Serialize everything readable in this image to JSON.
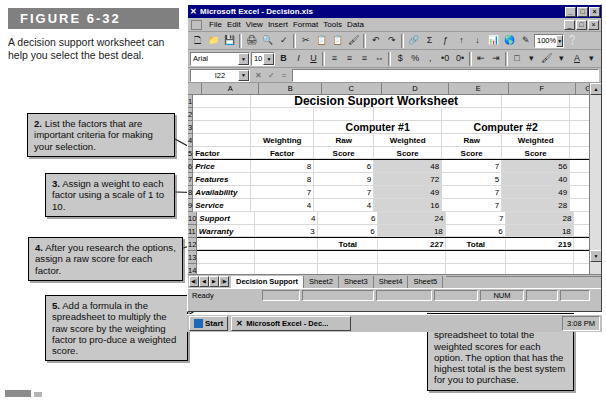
{
  "figure": {
    "label": "FIGURE 6-32",
    "caption": "A decision support worksheet can help you select the best deal.",
    "bar_color": "#808080"
  },
  "callouts": [
    {
      "num": "1.",
      "text": " List at least two possible options. This worksheet is designed to help you choose between Computer #1 and Computer #2."
    },
    {
      "num": "2.",
      "text": " List the factors that are important criteria for making your selection."
    },
    {
      "num": "3.",
      "text": " Assign a weight to each factor using a scale of 1 to 10."
    },
    {
      "num": "4.",
      "text": " After you research the options, assign a raw score for each factor."
    },
    {
      "num": "5.",
      "text": " Add a formula in the spreadsheet to multiply the raw score by the weighting factor to pro-duce a weighted score."
    },
    {
      "num": "6.",
      "text": " Add a formula in the spreadsheet to total the weighted scores for each option. The option that has the highest total is the best system for you to purchase."
    }
  ],
  "excel": {
    "title": "Microsoft Excel - Decision.xls",
    "title_icon": "excel-x-icon",
    "window_buttons": [
      "_",
      "□",
      "×"
    ],
    "child_window_buttons": [
      "_",
      "□",
      "×"
    ],
    "menus": [
      "File",
      "Edit",
      "View",
      "Insert",
      "Format",
      "Tools",
      "Data",
      "Window",
      "Help"
    ],
    "toolbar_icons": [
      "new-icon",
      "open-icon",
      "save-icon",
      "print-icon",
      "print-preview-icon",
      "spelling-icon",
      "cut-icon",
      "copy-icon",
      "paste-icon",
      "format-painter-icon",
      "undo-icon",
      "redo-icon",
      "hyperlink-icon",
      "autosum-icon",
      "function-icon",
      "sort-asc-icon",
      "sort-desc-icon",
      "chart-wizard-icon",
      "map-icon",
      "drawing-icon"
    ],
    "zoom_value": "100%",
    "formatting": {
      "font_name": "Arial",
      "font_size": "10",
      "bold": "B",
      "italic": "I",
      "underline": "U",
      "align_icons": [
        "align-left-icon",
        "align-center-icon",
        "align-right-icon",
        "merge-center-icon"
      ],
      "number_icons": [
        "currency-icon",
        "percent-icon",
        "comma-icon",
        "increase-decimal-icon",
        "decrease-decimal-icon"
      ],
      "indent_icons": [
        "decrease-indent-icon",
        "increase-indent-icon"
      ],
      "color_icons": [
        "borders-icon",
        "fill-color-icon",
        "font-color-icon"
      ]
    },
    "formula_bar": {
      "name_box": "I22",
      "cancel_icon": "cancel-icon",
      "enter_icon": "enter-icon",
      "function_icon": "function-icon",
      "formula_value": ""
    },
    "columns": [
      "A",
      "B",
      "C",
      "D",
      "E",
      "F",
      "G"
    ],
    "rows": [
      "1",
      "2",
      "3",
      "4",
      "5",
      "6",
      "7",
      "8",
      "9",
      "10",
      "11",
      "12",
      "13",
      "14",
      "15",
      "16"
    ],
    "sheet_title": "Decision Support Worksheet",
    "option_headers": [
      "Computer #1",
      "Computer #2"
    ],
    "table_headers": {
      "factor": [
        "Factor",
        ""
      ],
      "weighting": [
        "Weighting",
        "Factor"
      ],
      "raw1": [
        "Raw",
        "Score"
      ],
      "weighted1": [
        "Weighted",
        "Score"
      ],
      "raw2": [
        "Raw",
        "Score"
      ],
      "weighted2": [
        "Weighted",
        "Score"
      ]
    },
    "table_rows": [
      {
        "row": "6",
        "factor": "Price",
        "weight": "8",
        "raw1": "6",
        "weighted1": "48",
        "raw2": "7",
        "weighted2": "56"
      },
      {
        "row": "7",
        "factor": "Features",
        "weight": "8",
        "raw1": "9",
        "weighted1": "72",
        "raw2": "5",
        "weighted2": "40"
      },
      {
        "row": "8",
        "factor": "Availability",
        "weight": "7",
        "raw1": "7",
        "weighted1": "49",
        "raw2": "7",
        "weighted2": "49"
      },
      {
        "row": "9",
        "factor": "Service",
        "weight": "4",
        "raw1": "4",
        "weighted1": "16",
        "raw2": "7",
        "weighted2": "28"
      },
      {
        "row": "10",
        "factor": "Support",
        "weight": "4",
        "raw1": "6",
        "weighted1": "24",
        "raw2": "7",
        "weighted2": "28"
      },
      {
        "row": "11",
        "factor": "Warranty",
        "weight": "3",
        "raw1": "6",
        "weighted1": "18",
        "raw2": "6",
        "weighted2": "18"
      }
    ],
    "total_row": {
      "row": "12",
      "label1": "Total",
      "value1": "227",
      "label2": "Total",
      "value2": "219"
    },
    "sheet_tabs": [
      {
        "label": "Decision Support",
        "active": true
      },
      {
        "label": "Sheet2",
        "active": false
      },
      {
        "label": "Sheet3",
        "active": false
      },
      {
        "label": "Sheet4",
        "active": false
      },
      {
        "label": "Sheet5",
        "active": false
      }
    ],
    "tab_nav_icons": [
      "first-sheet-icon",
      "prev-sheet-icon",
      "next-sheet-icon",
      "last-sheet-icon"
    ],
    "status": {
      "mode": "Ready",
      "num_lock": "NUM"
    }
  },
  "taskbar": {
    "start_label": "Start",
    "task_label": "Microsoft Excel - Dec...",
    "task_icon": "excel-x-icon",
    "clock": "3:08 PM"
  }
}
